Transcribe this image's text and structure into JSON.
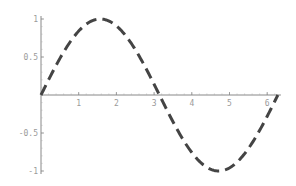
{
  "chart_data": {
    "type": "line",
    "title": "",
    "xlabel": "",
    "ylabel": "",
    "xlim": [
      0,
      6.2832
    ],
    "ylim": [
      -1,
      1
    ],
    "grid": false,
    "legend": null,
    "x_ticks": [
      1,
      2,
      3,
      4,
      5,
      6
    ],
    "x_tick_labels": [
      "1",
      "2",
      "3",
      "4",
      "5",
      "6"
    ],
    "y_ticks": [
      1,
      0.5,
      -0.5,
      -1
    ],
    "y_tick_labels": [
      "1",
      "0.5",
      "-0.5",
      "-1"
    ],
    "series": [
      {
        "name": "sin(x)",
        "style": "dashed",
        "color": "#444444",
        "x": [
          0,
          0.5236,
          1.0472,
          1.5708,
          2.0944,
          2.618,
          3.1416,
          3.6652,
          4.1888,
          4.7124,
          5.236,
          5.7596,
          6.2832
        ],
        "values": [
          0,
          0.5,
          0.866,
          1,
          0.866,
          0.5,
          0,
          -0.5,
          -0.866,
          -1,
          -0.866,
          -0.5,
          0
        ]
      }
    ]
  },
  "style": {
    "axis_color": "#888888",
    "label_color": "#9a9a9a",
    "line_color": "#444444"
  }
}
